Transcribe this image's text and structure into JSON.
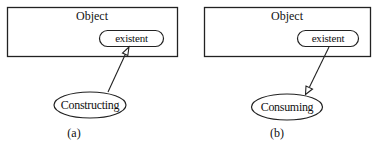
{
  "diagram": {
    "panels": [
      {
        "id": "a",
        "caption": "(a)",
        "box_title": "Object",
        "state_label": "existent",
        "process_label": "Constructing",
        "arrow_direction": "process-to-state"
      },
      {
        "id": "b",
        "caption": "(b)",
        "box_title": "Object",
        "state_label": "existent",
        "process_label": "Consuming",
        "arrow_direction": "state-to-process"
      }
    ],
    "colors": {
      "stroke": "#222222",
      "text": "#111111",
      "background": "#ffffff"
    }
  }
}
